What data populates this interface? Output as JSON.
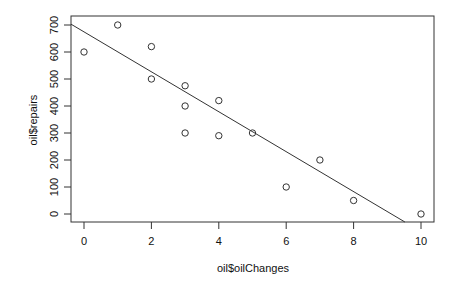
{
  "chart_data": {
    "type": "scatter",
    "title": "",
    "xlabel": "oil$oilChanges",
    "ylabel": "oil$repairs",
    "xlim": [
      -0.38,
      10.38
    ],
    "ylim": [
      -28,
      728
    ],
    "x_ticks": [
      0,
      2,
      4,
      6,
      8,
      10
    ],
    "y_ticks": [
      0,
      100,
      200,
      300,
      400,
      500,
      600,
      700
    ],
    "grid": false,
    "legend": null,
    "series": [
      {
        "name": "points",
        "marker": "open-circle",
        "x": [
          0,
          1,
          2,
          2,
          3,
          3,
          3,
          4,
          4,
          5,
          6,
          7,
          8,
          10
        ],
        "y": [
          600,
          700,
          620,
          500,
          475,
          400,
          300,
          420,
          290,
          300,
          100,
          200,
          50,
          0
        ]
      }
    ],
    "regression_line": {
      "intercept": 675,
      "slope": -74
    }
  },
  "axes": {
    "xlabel": "oil$oilChanges",
    "ylabel": "oil$repairs"
  }
}
